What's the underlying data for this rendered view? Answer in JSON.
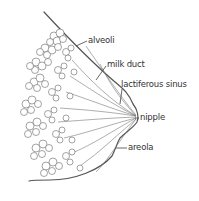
{
  "diagram": {
    "line_color": "#555555",
    "labels": [
      {
        "id": "alveoli",
        "text": "alveoli"
      },
      {
        "id": "milk-duct",
        "text": "milk duct"
      },
      {
        "id": "lactiferous-sinus",
        "text": "lactiferous sinus"
      },
      {
        "id": "nipple",
        "text": "nipple"
      },
      {
        "id": "areola",
        "text": "areola"
      }
    ]
  }
}
